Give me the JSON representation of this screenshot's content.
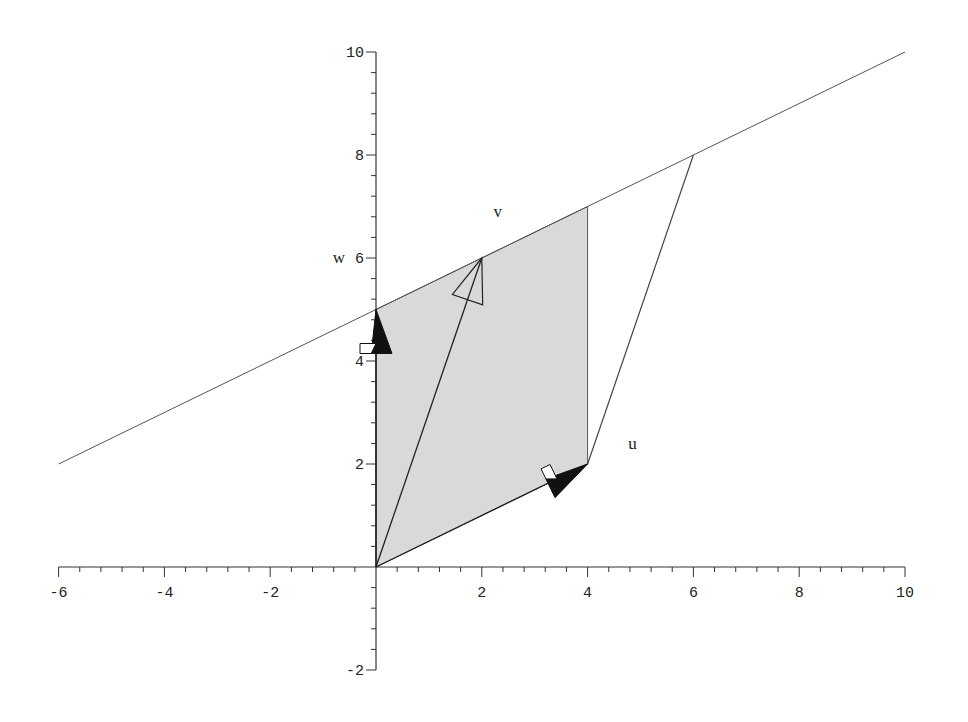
{
  "chart_data": {
    "type": "line",
    "title": "",
    "xlabel": "",
    "ylabel": "",
    "xlim": [
      -6,
      10
    ],
    "ylim": [
      -2,
      10
    ],
    "grid": false,
    "x_ticks": [
      -6,
      -4,
      -2,
      2,
      4,
      6,
      8,
      10
    ],
    "y_ticks": [
      -2,
      2,
      4,
      6,
      8,
      10
    ],
    "x_tick_labels": [
      "-6",
      "-4",
      "-2",
      "2",
      "4",
      "6",
      "8",
      "10"
    ],
    "y_tick_labels": [
      "-2",
      "2",
      "4",
      "6",
      "8",
      "10"
    ],
    "line": {
      "equation": "y = 0.5x + 5",
      "from": [
        -6,
        2
      ],
      "to": [
        10,
        10
      ]
    },
    "shaded_parallelogram": {
      "vertices": [
        [
          0,
          0
        ],
        [
          4,
          2
        ],
        [
          4,
          7
        ],
        [
          0,
          5
        ]
      ],
      "fill": "#d9d9d9"
    },
    "outline_segments": [
      {
        "from": [
          4,
          2
        ],
        "to": [
          6,
          8
        ]
      }
    ],
    "vectors": [
      {
        "name": "u",
        "from": [
          0,
          0
        ],
        "to": [
          4,
          2
        ],
        "label": "u",
        "label_pos": [
          4.85,
          2.3
        ],
        "head_style": "filled"
      },
      {
        "name": "v",
        "from": [
          0,
          0
        ],
        "to": [
          2,
          6
        ],
        "label": "v",
        "label_pos": [
          2.3,
          6.8
        ],
        "head_style": "open"
      },
      {
        "name": "w",
        "from": [
          0,
          0
        ],
        "to": [
          0,
          5
        ],
        "label": "w",
        "label_pos": [
          -0.7,
          5.9
        ],
        "head_style": "filled"
      }
    ]
  },
  "labels": {
    "u": "u",
    "v": "v",
    "w": "w"
  }
}
